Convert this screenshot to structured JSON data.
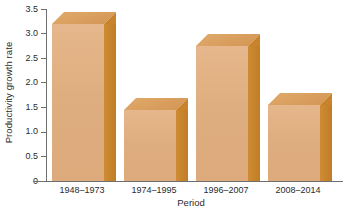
{
  "chart_data": {
    "type": "bar",
    "title": "",
    "xlabel": "Period",
    "ylabel": "Productivity growth rate",
    "categories": [
      "1948–1973",
      "1974–1995",
      "1996–2007",
      "2008–2014"
    ],
    "values": [
      3.2,
      1.45,
      2.75,
      1.55
    ],
    "ylim": [
      0,
      3.5
    ],
    "yticks": [
      "0",
      "0.5",
      "1.0",
      "1.5",
      "2.0",
      "2.5",
      "3.0",
      "3.5"
    ],
    "ytick_values": [
      0,
      0.5,
      1.0,
      1.5,
      2.0,
      2.5,
      3.0,
      3.5
    ],
    "grid": false,
    "legend": null,
    "style": "3d-bar",
    "colors": {
      "bar_front": "#dfae80",
      "bar_side": "#c8832c",
      "bar_top": "#d89f5d",
      "axis": "#6f6f6f",
      "text": "#2b2b2b",
      "background": "#ffffff"
    }
  }
}
